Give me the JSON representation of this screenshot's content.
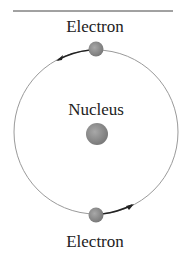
{
  "diagram": {
    "labels": {
      "top_electron": "Electron",
      "nucleus": "Nucleus",
      "bottom_electron": "Electron"
    },
    "colors": {
      "orbit": "#9a9a9a",
      "particle": "#8a8a8a",
      "arrow": "#222222",
      "rule": "#444444"
    }
  }
}
